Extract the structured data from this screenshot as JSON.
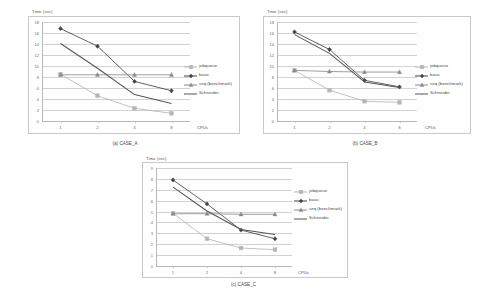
{
  "figure": {
    "series_names": [
      "jobqueue",
      "basic",
      "seq (benchmark)",
      "Schneider"
    ],
    "colors": {
      "jobqueue": "#b6b6b6",
      "basic": "#444444",
      "seq": "#8c8c8c",
      "schneider": "#555555",
      "grid": "#d2d2d2",
      "axis": "#b8b8b8",
      "text": "#5a5a5a"
    }
  },
  "chart_data": [
    {
      "id": "a",
      "type": "line",
      "title": "",
      "caption": "(a) CASE_A",
      "xlabel": "CPUs",
      "ylabel": "Time (sec)",
      "categories": [
        "1",
        "2",
        "4",
        "8"
      ],
      "xticks": [
        "1",
        "2",
        "4",
        "8"
      ],
      "yticks": [
        "18",
        "16",
        "14",
        "12",
        "10",
        "8",
        "6",
        "4",
        "2",
        "0"
      ],
      "ylim": [
        0,
        18
      ],
      "grid": true,
      "legend_position": "right",
      "series": [
        {
          "name": "jobqueue",
          "values": [
            8.5,
            4.6,
            2.3,
            1.4
          ],
          "marker": "square",
          "color": "#b6b6b6"
        },
        {
          "name": "basic",
          "values": [
            16.8,
            13.6,
            7.2,
            5.5
          ],
          "marker": "diamond",
          "color": "#444444"
        },
        {
          "name": "seq (benchmark)",
          "values": [
            8.4,
            8.4,
            8.4,
            8.4
          ],
          "marker": "triangle",
          "color": "#8c8c8c"
        },
        {
          "name": "Schneider",
          "values": [
            14.1,
            9.6,
            4.8,
            3.2
          ],
          "marker": "none",
          "color": "#555555"
        }
      ]
    },
    {
      "id": "b",
      "type": "line",
      "title": "",
      "caption": "(b) CASE_B",
      "xlabel": "CPUs",
      "ylabel": "Time (sec)",
      "categories": [
        "1",
        "2",
        "4",
        "8"
      ],
      "xticks": [
        "1",
        "2",
        "4",
        "8"
      ],
      "yticks": [
        "18",
        "16",
        "14",
        "12",
        "10",
        "8",
        "6",
        "4",
        "2",
        "0"
      ],
      "ylim": [
        0,
        18
      ],
      "grid": true,
      "legend_position": "right",
      "series": [
        {
          "name": "jobqueue",
          "values": [
            9.2,
            5.6,
            3.6,
            3.4
          ],
          "marker": "square",
          "color": "#b6b6b6"
        },
        {
          "name": "basic",
          "values": [
            16.2,
            13.0,
            7.4,
            6.2
          ],
          "marker": "diamond",
          "color": "#444444"
        },
        {
          "name": "seq (benchmark)",
          "values": [
            9.2,
            9.0,
            8.9,
            8.9
          ],
          "marker": "triangle",
          "color": "#8c8c8c"
        },
        {
          "name": "Schneider",
          "values": [
            15.7,
            12.3,
            7.1,
            6.1
          ],
          "marker": "none",
          "color": "#555555"
        }
      ]
    },
    {
      "id": "c",
      "type": "line",
      "title": "",
      "caption": "(c) CASE_C",
      "xlabel": "CPUs",
      "ylabel": "Time (sec)",
      "categories": [
        "1",
        "2",
        "4",
        "8"
      ],
      "xticks": [
        "1",
        "2",
        "4",
        "8"
      ],
      "yticks": [
        "9",
        "8",
        "7",
        "6",
        "5",
        "4",
        "3",
        "2",
        "1",
        "0"
      ],
      "ylim": [
        0,
        9
      ],
      "grid": true,
      "legend_position": "right",
      "series": [
        {
          "name": "jobqueue",
          "values": [
            4.85,
            2.5,
            1.65,
            1.5
          ],
          "marker": "square",
          "color": "#b6b6b6"
        },
        {
          "name": "basic",
          "values": [
            7.9,
            5.7,
            3.3,
            2.5
          ],
          "marker": "diamond",
          "color": "#444444"
        },
        {
          "name": "seq (benchmark)",
          "values": [
            4.8,
            4.8,
            4.75,
            4.75
          ],
          "marker": "triangle",
          "color": "#8c8c8c"
        },
        {
          "name": "Schneider",
          "values": [
            7.25,
            5.05,
            3.35,
            2.9
          ],
          "marker": "none",
          "color": "#555555"
        }
      ]
    }
  ]
}
